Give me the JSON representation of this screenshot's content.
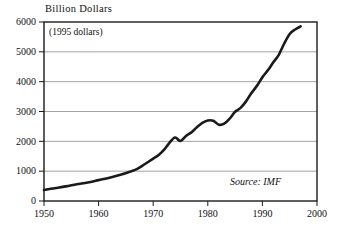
{
  "chart_data": {
    "type": "line",
    "title": "Billion Dollars",
    "subtitle": "(1995 dollars)",
    "annotation": "Source: IMF",
    "xlabel": "",
    "ylabel": "Billion Dollars",
    "xlim": [
      1950,
      2000
    ],
    "ylim": [
      0,
      6000
    ],
    "grid": "horizontal",
    "legend": "none",
    "xticks": [
      1950,
      1960,
      1970,
      1980,
      1990,
      2000
    ],
    "xtick_labels": [
      "1950",
      "1960",
      "1970",
      "1980",
      "1990",
      "2000"
    ],
    "yticks": [
      0,
      1000,
      2000,
      3000,
      4000,
      5000,
      6000
    ],
    "ytick_labels": [
      "0",
      "1000",
      "2000",
      "3000",
      "4000",
      "5000",
      "6000"
    ],
    "series": [
      {
        "name": "World merchandise exports",
        "color": "#1a1a1a",
        "x": [
          1950,
          1952,
          1954,
          1956,
          1958,
          1960,
          1962,
          1964,
          1966,
          1967,
          1968,
          1969,
          1970,
          1971,
          1972,
          1973,
          1974,
          1975,
          1976,
          1977,
          1978,
          1979,
          1980,
          1981,
          1982,
          1983,
          1984,
          1985,
          1986,
          1987,
          1988,
          1989,
          1990,
          1991,
          1992,
          1993,
          1994,
          1995,
          1996,
          1997
        ],
        "values": [
          370,
          430,
          490,
          560,
          620,
          700,
          780,
          880,
          1000,
          1070,
          1180,
          1300,
          1420,
          1540,
          1720,
          1960,
          2130,
          2010,
          2180,
          2300,
          2470,
          2620,
          2700,
          2690,
          2560,
          2590,
          2760,
          2990,
          3120,
          3340,
          3620,
          3860,
          4150,
          4380,
          4650,
          4900,
          5280,
          5600,
          5750,
          5850
        ]
      }
    ]
  },
  "axis_title": "Billion Dollars",
  "subtitle": "(1995 dollars)",
  "source": "Source: IMF"
}
